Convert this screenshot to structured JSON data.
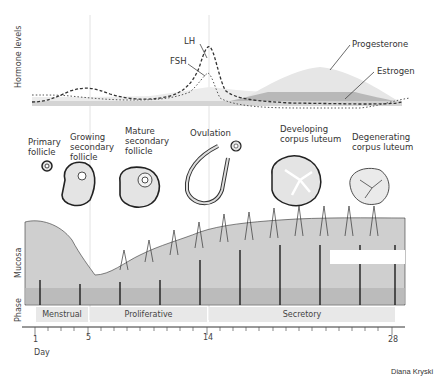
{
  "hormones": {
    "axis_label": "Hormone levels",
    "labels": {
      "lh": "LH",
      "fsh": "FSH",
      "progesterone": "Progesterone",
      "estrogen": "Estrogen"
    }
  },
  "ovary_stages": [
    {
      "label_line1": "Primary",
      "label_line2": "follicle",
      "label_line3": ""
    },
    {
      "label_line1": "Growing",
      "label_line2": "secondary",
      "label_line3": "follicle"
    },
    {
      "label_line1": "Mature",
      "label_line2": "secondary",
      "label_line3": "follicle"
    },
    {
      "label_line1": "Ovulation",
      "label_line2": "",
      "label_line3": ""
    },
    {
      "label_line1": "Developing",
      "label_line2": "corpus luteum",
      "label_line3": ""
    },
    {
      "label_line1": "Degenerating",
      "label_line2": "corpus luteum",
      "label_line3": ""
    }
  ],
  "mucosa": {
    "axis_label": "Mucosa"
  },
  "phase": {
    "axis_label": "Phase",
    "phases": [
      {
        "label": "Menstrual"
      },
      {
        "label": "Proliferative"
      },
      {
        "label": "Secretory"
      }
    ]
  },
  "timeline": {
    "axis_label": "Day",
    "ticks": [
      {
        "label": "1"
      },
      {
        "label": "5"
      },
      {
        "label": "14"
      },
      {
        "label": "28"
      }
    ]
  },
  "credit": "Diana Kryski"
}
